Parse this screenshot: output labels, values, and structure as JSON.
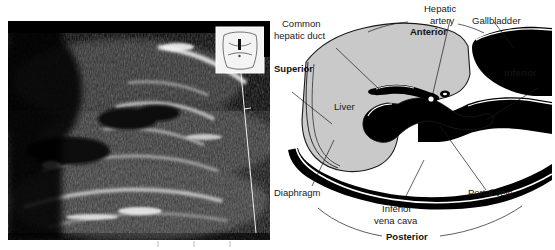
{
  "ultrasound": {
    "name": "liver-sagittal-ultrasound",
    "body_marker": "torso-body-marker",
    "probe_indicator": "probe-position-bar",
    "depth_line": "depth-marker-line",
    "scale_ticks": "depth-scale-ticks"
  },
  "diagram": {
    "name": "liver-anatomy-diagram",
    "structures": [
      {
        "id": "liver",
        "label": "Liver",
        "fill": "#c9c9c9"
      },
      {
        "id": "portal-vein",
        "label": "Portal vein",
        "fill": "#000000"
      },
      {
        "id": "gallbladder",
        "label": "Gallbladder",
        "fill": "#000000"
      },
      {
        "id": "inferior-vena-cava",
        "label": "Inferior\nvena cava",
        "fill": "#000000"
      },
      {
        "id": "diaphragm",
        "label": "Diaphragm",
        "fill": "#000000"
      },
      {
        "id": "hepatic-artery",
        "label": "Hepatic\nartery",
        "fill": "#000000"
      },
      {
        "id": "common-hepatic-duct",
        "label": "Common\nhepatic duct",
        "fill": "#000000"
      }
    ],
    "labels": {
      "liver": "Liver",
      "portal_vein": "Portal vein",
      "gallbladder": "Gallbladder",
      "inferior_vena_cava_line1": "Inferior",
      "inferior_vena_cava_line2": "vena cava",
      "diaphragm": "Diaphragm",
      "hepatic_artery_line1": "Hepatic",
      "hepatic_artery_line2": "artery",
      "common_hepatic_duct_line1": "Common",
      "common_hepatic_duct_line2": "hepatic duct"
    },
    "orientation": {
      "anterior": "Anterior",
      "posterior": "Posterior",
      "superior": "Superior",
      "inferior": "Inferior"
    },
    "colors": {
      "liver_fill": "#c9c9c9",
      "vessel_fill": "#000000",
      "outline": "#1a1a1a",
      "text": "#1a1a1a",
      "background": "#ffffff"
    }
  }
}
